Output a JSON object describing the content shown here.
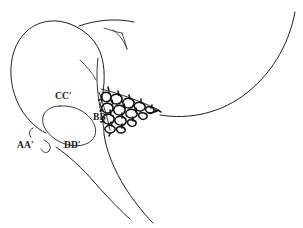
{
  "figure": {
    "type": "anatomical-line-drawing",
    "background_color": "#ffffff",
    "stroke_color": "#231f20",
    "texture_color": "#111111",
    "width": 303,
    "height": 228,
    "labels": [
      {
        "id": "cc",
        "text": "CC′",
        "x": 55,
        "y": 92,
        "name": "label-cc-prime"
      },
      {
        "id": "bb",
        "text": "BB′",
        "x": 93,
        "y": 113,
        "name": "label-bb-prime"
      },
      {
        "id": "aa",
        "text": "AA′",
        "x": 17,
        "y": 141,
        "name": "label-aa-prime"
      },
      {
        "id": "dd",
        "text": "DD′",
        "x": 64,
        "y": 141,
        "name": "label-dd-prime"
      }
    ],
    "regions": [
      {
        "id": "outer-body",
        "name": "outer-body-outline",
        "description": "large rounded cranial outline at left"
      },
      {
        "id": "inner-oval",
        "name": "inner-oval-outline",
        "description": "small oval inside the cranial outline"
      },
      {
        "id": "texture-wedge",
        "name": "trabecular-texture-wedge",
        "description": "cellular / trabecular shaded wedge tapering to the right"
      },
      {
        "id": "upper-sweep",
        "name": "upper-sweep-curve",
        "description": "long curve sweeping up to the right edge"
      },
      {
        "id": "lower-sweep",
        "name": "lower-sweep-curve",
        "description": "long curve along the lower right"
      },
      {
        "id": "fork",
        "name": "upper-fork-branch",
        "description": "Y-shaped branching line at top"
      },
      {
        "id": "stalk-left",
        "name": "stalk-left-curve",
        "description": "left curve of the descending stalk"
      },
      {
        "id": "stalk-right",
        "name": "stalk-right-curve",
        "description": "right curve of the descending stalk"
      },
      {
        "id": "hook-aa",
        "name": "aa-hook-mark",
        "description": "small hook mark next to AA prime"
      },
      {
        "id": "crescent-aa",
        "name": "aa-crescent-mark",
        "description": "small crescent mark above AA prime"
      }
    ]
  }
}
